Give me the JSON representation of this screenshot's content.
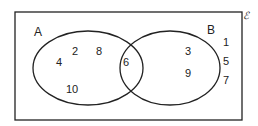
{
  "diagram": {
    "type": "venn",
    "universal_label": "ℰ",
    "sets": [
      {
        "label": "A",
        "only": [
          "2",
          "8",
          "4",
          "10"
        ]
      },
      {
        "label": "B",
        "only": [
          "3",
          "9"
        ]
      }
    ],
    "intersection": [
      "6"
    ],
    "outside": [
      "1",
      "5",
      "7"
    ],
    "colors": {
      "stroke": "#222222",
      "background": "#ffffff"
    }
  }
}
